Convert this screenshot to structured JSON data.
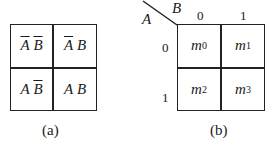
{
  "diagram_a": {
    "caption": "(a)",
    "cells": [
      {
        "row": 0,
        "col": 0,
        "var1": "A",
        "var1_bar": true,
        "var2": "B",
        "var2_bar": true
      },
      {
        "row": 0,
        "col": 1,
        "var1": "A",
        "var1_bar": true,
        "var2": "B",
        "var2_bar": false
      },
      {
        "row": 1,
        "col": 0,
        "var1": "A",
        "var1_bar": false,
        "var2": "B",
        "var2_bar": true
      },
      {
        "row": 1,
        "col": 1,
        "var1": "A",
        "var1_bar": false,
        "var2": "B",
        "var2_bar": false
      }
    ]
  },
  "diagram_b": {
    "caption": "(b)",
    "row_var": "A",
    "col_var": "B",
    "col_headers": [
      "0",
      "1"
    ],
    "row_headers": [
      "0",
      "1"
    ],
    "cells": [
      {
        "m": "m",
        "sub": "0"
      },
      {
        "m": "m",
        "sub": "1"
      },
      {
        "m": "m",
        "sub": "2"
      },
      {
        "m": "m",
        "sub": "3"
      }
    ]
  }
}
